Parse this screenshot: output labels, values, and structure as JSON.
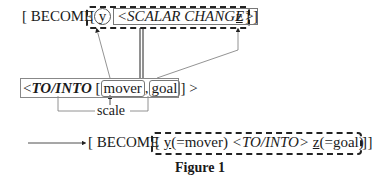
{
  "top": {
    "open": "[ BECOME",
    "inner_open": "[",
    "var_y": "y",
    "scalar_change": "<SCALAR CHANGE>",
    "var_z": "z",
    "inner_close": "]",
    "close": "]"
  },
  "middle": {
    "lt": "<",
    "to_into": "TO/INTO",
    "bracket_open": "[",
    "mover": "mover",
    "comma": ",",
    "goal": "goal",
    "bracket_close": "]",
    "gt": ">",
    "scale": "scale"
  },
  "bottom": {
    "open": "[ BECOME",
    "inner_open": "[",
    "y_part": "y",
    "y_role": "(=mover)",
    "to_into": "<TO/INTO>",
    "z_part": "z",
    "z_role": "(=goal)",
    "inner_close": "]",
    "close": "]"
  },
  "caption": "Figure 1"
}
